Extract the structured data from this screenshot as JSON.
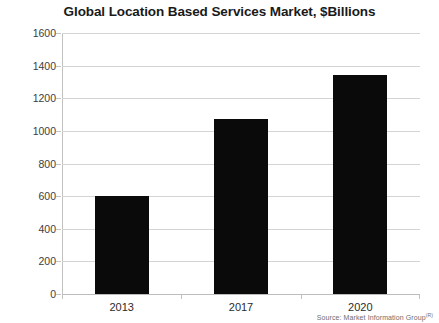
{
  "chart_data": {
    "type": "bar",
    "title": "Global Location Based Services Market, $Billions",
    "categories": [
      "2013",
      "2017",
      "2020"
    ],
    "values": [
      600,
      1075,
      1340
    ],
    "xlabel": "",
    "ylabel": "",
    "ylim": [
      0,
      1600
    ],
    "yticks": [
      0,
      200,
      400,
      600,
      800,
      1000,
      1200,
      1400,
      1600
    ],
    "ytick_labels": [
      "0",
      "200",
      "400",
      "600",
      "800",
      "1000",
      "1200",
      "1400",
      "1600"
    ],
    "grid": true,
    "legend": false,
    "bar_color": "#0a0a0a",
    "gridline_color": "#d4d4d4",
    "axis_color": "#c2c2c2",
    "title_color": "#1a1a1a",
    "annotations": {
      "source": "Source: Market Information Group",
      "source_superscript": "(R)"
    }
  }
}
